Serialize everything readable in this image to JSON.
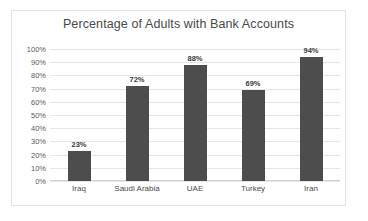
{
  "chart_data": {
    "type": "bar",
    "title": "Percentage of Adults with Bank Accounts",
    "categories": [
      "Iraq",
      "Saudi Arabia",
      "UAE",
      "Turkey",
      "Iran"
    ],
    "values": [
      23,
      72,
      88,
      69,
      94
    ],
    "value_labels": [
      "23%",
      "72%",
      "88%",
      "69%",
      "94%"
    ],
    "xlabel": "",
    "ylabel": "",
    "ylim": [
      0,
      100
    ],
    "ytick_values": [
      100,
      90,
      80,
      70,
      60,
      50,
      40,
      30,
      20,
      10,
      0
    ],
    "ytick_labels": [
      "100%",
      "90%",
      "80%",
      "70%",
      "60%",
      "50%",
      "40%",
      "30%",
      "20%",
      "10%",
      "0%"
    ],
    "grid": true,
    "legend": false,
    "colors": {
      "bar": "#4d4d4d",
      "title_text": "#4a4a4a",
      "tick_text": "#5a5a5a",
      "label_text": "#3a3a3a",
      "gridline": "#e6e6e6",
      "border": "#e2e2e2",
      "background": "#ffffff"
    }
  }
}
